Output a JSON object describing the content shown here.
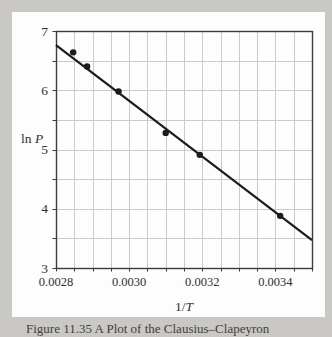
{
  "figure": {
    "background_color": "#c9c8c5",
    "panel_color": "#fdfdfd"
  },
  "axes": {
    "y_title_prefix": "ln ",
    "y_title_var": "P",
    "x_title_prefix": "1/",
    "x_title_var": "T"
  },
  "caption": {
    "text": "Figure 11.35  A Plot of the Clausius–Clapeyron"
  },
  "chart_data": {
    "type": "scatter",
    "title": "",
    "xlabel": "1/T",
    "ylabel": "ln P",
    "xlim": [
      0.0028,
      0.0035
    ],
    "ylim": [
      3,
      7
    ],
    "x_minor_step": 5e-05,
    "y_minor_step": 0.5,
    "grid": "minor-both",
    "x_ticks": [
      0.0028,
      0.003,
      0.0032,
      0.0034
    ],
    "x_tick_labels": [
      "0.0028",
      "0.0030",
      "0.0032",
      "0.0034"
    ],
    "y_ticks": [
      7,
      6,
      5,
      4,
      3
    ],
    "y_tick_labels": [
      "7",
      "6",
      "5",
      "4",
      "3"
    ],
    "points": [
      [
        0.002847,
        6.64
      ],
      [
        0.002885,
        6.4
      ],
      [
        0.002971,
        5.98
      ],
      [
        0.0031,
        5.28
      ],
      [
        0.003193,
        4.91
      ],
      [
        0.003413,
        3.88
      ]
    ],
    "fit_line": {
      "x1": 0.0028,
      "y1": 6.76,
      "x2": 0.0035,
      "y2": 3.47
    },
    "colors": {
      "grid": "#c6ccc6",
      "frame": "#3c3c3c",
      "line": "#1b1b1b",
      "point": "#1b1b1b",
      "text": "#2f2f2f"
    }
  }
}
